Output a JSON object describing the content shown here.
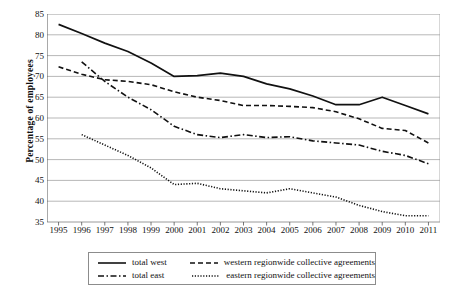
{
  "chart_data": {
    "type": "line",
    "title": "",
    "xlabel": "",
    "ylabel": "Percentage of employees",
    "grid": true,
    "legend_position": "bottom",
    "ylim": [
      35,
      85
    ],
    "yticks": [
      35,
      40,
      45,
      50,
      55,
      60,
      65,
      70,
      75,
      80,
      85
    ],
    "categories": [
      "1995",
      "1996",
      "1997",
      "1998",
      "1999",
      "2000",
      "2001",
      "2002",
      "2003",
      "2004",
      "2005",
      "2006",
      "2007",
      "2008",
      "2009",
      "2010",
      "2011"
    ],
    "series": [
      {
        "name": "total west",
        "style": "solid",
        "values": [
          82.5,
          80.3,
          78.0,
          76.0,
          73.2,
          70.0,
          70.2,
          70.8,
          70.0,
          68.2,
          67.0,
          65.3,
          63.2,
          63.2,
          65.0,
          63.0,
          61.0
        ]
      },
      {
        "name": "western regionwide collective agreements",
        "style": "dashed",
        "values": [
          72.3,
          70.5,
          69.2,
          68.8,
          68.0,
          66.3,
          65.0,
          64.2,
          63.0,
          63.0,
          62.8,
          62.5,
          61.5,
          59.8,
          57.5,
          57.0,
          54.0
        ]
      },
      {
        "name": "total east",
        "style": "dash-dot",
        "values": [
          null,
          73.5,
          68.8,
          65.0,
          62.0,
          58.0,
          56.0,
          55.3,
          56.0,
          55.3,
          55.5,
          54.5,
          54.0,
          53.5,
          52.0,
          51.0,
          49.0
        ]
      },
      {
        "name": "eastern regionwide collective agreements",
        "style": "dotted",
        "values": [
          null,
          56.0,
          53.5,
          51.0,
          48.0,
          44.0,
          44.3,
          43.0,
          42.5,
          42.0,
          43.0,
          42.0,
          41.0,
          39.0,
          37.5,
          36.5,
          36.5
        ]
      }
    ]
  },
  "legend": {
    "items": [
      {
        "label": "total west",
        "style": "solid"
      },
      {
        "label": "western regionwide collective agreements",
        "style": "dashed"
      },
      {
        "label": "total east",
        "style": "dash-dot"
      },
      {
        "label": "eastern regionwide collective agreements",
        "style": "dotted"
      }
    ]
  }
}
